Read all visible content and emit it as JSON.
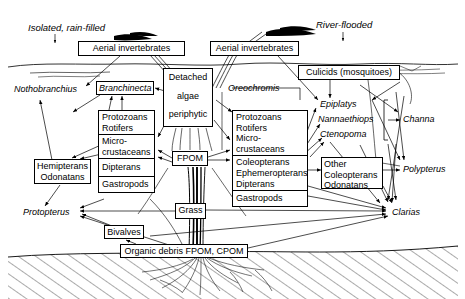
{
  "figure": {
    "title_left": "Isolated, rain-filled",
    "title_right": "River-flooded"
  },
  "boxes": {
    "aerial_left": "Aerial invertebrates",
    "aerial_right": "Aerial invertebrates",
    "culicids": "Culicids  (mosquitoes)",
    "branchinecta": "Branchinecta",
    "detached_algae_l1": "Detached",
    "detached_algae_l2": "algae",
    "detached_algae_l3": "periphytic",
    "fpom": "FPOM",
    "grass": "Grass",
    "bivalves": "Bivalves",
    "organic_debris": "Organic debris FPOM, CPOM",
    "hemipterans_l1": "Hemipterans",
    "hemipterans_l2": "Odonatans",
    "other_col_l1": "Other",
    "other_col_l2": "Coleopterans",
    "other_col_l3": "Odonatans"
  },
  "left_stack": {
    "cells": [
      "Protozoans\nRotifers",
      "Micro-\ncrustaceans",
      "Dipterans",
      "Gastropods"
    ],
    "c0a": "Protozoans",
    "c0b": "Rotifers",
    "c1a": "Micro-",
    "c1b": "crustaceans",
    "c2": "Dipterans",
    "c3": "Gastropods"
  },
  "right_stack": {
    "c0a": "Protozoans",
    "c0b": "Rotifers",
    "c0c": "Micro-",
    "c0d": "crustaceans",
    "c1a": "Coleopterans",
    "c1b": "Ephemeropterans",
    "c1c": "Dipterans",
    "c2": "Gastropods"
  },
  "fish": {
    "nothobranchius": "Nothobranchius",
    "protopterus": "Protopterus",
    "oreochromis": "Oreochromis",
    "epiplatys": "Epiplatys",
    "nannaethiops": "Nannaethiops",
    "ctenopoma": "Ctenopoma",
    "channa": "Channa",
    "polypterus": "Polypterus",
    "clarias": "Clarias"
  },
  "colors": {
    "ink": "#000000",
    "background": "#ffffff"
  }
}
